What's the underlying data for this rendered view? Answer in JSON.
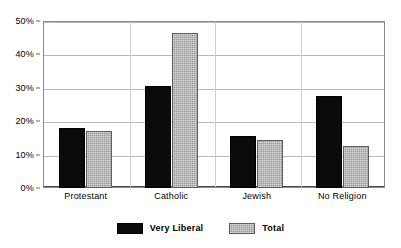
{
  "chart_data": {
    "type": "bar",
    "title": "",
    "subtitle": "",
    "xlabel": "",
    "ylabel": "",
    "categories": [
      "Protestant",
      "Catholic",
      "Jewish",
      "No Religion"
    ],
    "series": [
      {
        "name": "Very Liberal",
        "values": [
          18,
          30.5,
          15.5,
          27.5
        ],
        "color": "#0b0b0b",
        "pattern": "solid"
      },
      {
        "name": "Total",
        "values": [
          17,
          46.5,
          14.5,
          12.5
        ],
        "color": "#9a9a9a",
        "pattern": "hatched"
      }
    ],
    "ylim": [
      0,
      50
    ],
    "ytick_values": [
      0,
      10,
      20,
      30,
      40,
      50
    ],
    "ytick_labels": [
      "0%",
      "10%",
      "20%",
      "30%",
      "40%",
      "50%"
    ],
    "grid": true,
    "grid_axis": "y",
    "legend_position": "bottom",
    "value_suffix": "%"
  },
  "legend": {
    "items": [
      {
        "label": "Very Liberal"
      },
      {
        "label": "Total"
      }
    ]
  },
  "colors": {
    "series_very_liberal": "#0b0b0b",
    "series_total": "#9a9a9a",
    "gridline": "#b9b9b9",
    "frame": "#8a8a8a",
    "background": "#ffffff",
    "text": "#000000"
  }
}
